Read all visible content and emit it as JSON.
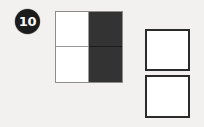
{
  "page": {
    "background_color": "#f2f1ef",
    "type": "visual-reasoning-question"
  },
  "question": {
    "number_label": "10",
    "badge_background_color": "#1c1c1c",
    "badge_text_color": "#ffffff"
  },
  "figure": {
    "name": "two-by-two-matrix",
    "border_color": "#8d8d8d",
    "light_color": "#ffffff",
    "dark_color": "#333334",
    "cells": [
      {
        "position": "top-left",
        "fill": "light",
        "fill_label": "white"
      },
      {
        "position": "top-right",
        "fill": "dark",
        "fill_label": "black"
      },
      {
        "position": "bottom-left",
        "fill": "light",
        "fill_label": "white"
      },
      {
        "position": "bottom-right",
        "fill": "dark",
        "fill_label": "black"
      }
    ]
  },
  "options": {
    "border_color": "#2b2b2b",
    "fill_color": "#ffffff",
    "items": [
      {
        "index": "1",
        "fill_label": "blank-white-square"
      },
      {
        "index": "2",
        "fill_label": "blank-white-square"
      }
    ]
  }
}
